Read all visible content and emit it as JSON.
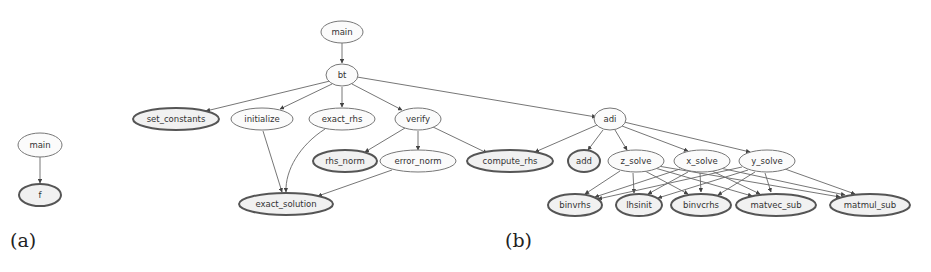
{
  "figure": {
    "panels": [
      {
        "id": "a",
        "caption": "(a)",
        "nodes": [
          {
            "id": "main",
            "label": "main",
            "leaf": false
          },
          {
            "id": "f",
            "label": "f",
            "leaf": true
          }
        ],
        "edges": [
          [
            "main",
            "f"
          ]
        ]
      },
      {
        "id": "b",
        "caption": "(b)",
        "nodes": [
          {
            "id": "main",
            "label": "main",
            "leaf": false
          },
          {
            "id": "bt",
            "label": "bt",
            "leaf": false
          },
          {
            "id": "set_constants",
            "label": "set_constants",
            "leaf": true
          },
          {
            "id": "initialize",
            "label": "initialize",
            "leaf": false
          },
          {
            "id": "exact_rhs",
            "label": "exact_rhs",
            "leaf": false
          },
          {
            "id": "verify",
            "label": "verify",
            "leaf": false
          },
          {
            "id": "adi",
            "label": "adi",
            "leaf": false
          },
          {
            "id": "rhs_norm",
            "label": "rhs_norm",
            "leaf": true
          },
          {
            "id": "error_norm",
            "label": "error_norm",
            "leaf": false
          },
          {
            "id": "compute_rhs",
            "label": "compute_rhs",
            "leaf": true
          },
          {
            "id": "add",
            "label": "add",
            "leaf": true
          },
          {
            "id": "z_solve",
            "label": "z_solve",
            "leaf": false
          },
          {
            "id": "x_solve",
            "label": "x_solve",
            "leaf": false
          },
          {
            "id": "y_solve",
            "label": "y_solve",
            "leaf": false
          },
          {
            "id": "exact_solution",
            "label": "exact_solution",
            "leaf": true
          },
          {
            "id": "binvrhs",
            "label": "binvrhs",
            "leaf": true
          },
          {
            "id": "lhsinit",
            "label": "lhsinit",
            "leaf": true
          },
          {
            "id": "binvcrhs",
            "label": "binvcrhs",
            "leaf": true
          },
          {
            "id": "matvec_sub",
            "label": "matvec_sub",
            "leaf": true
          },
          {
            "id": "matmul_sub",
            "label": "matmul_sub",
            "leaf": true
          }
        ],
        "edges": [
          [
            "main",
            "bt"
          ],
          [
            "bt",
            "set_constants"
          ],
          [
            "bt",
            "initialize"
          ],
          [
            "bt",
            "exact_rhs"
          ],
          [
            "bt",
            "verify"
          ],
          [
            "bt",
            "adi"
          ],
          [
            "initialize",
            "exact_solution"
          ],
          [
            "exact_rhs",
            "exact_solution"
          ],
          [
            "verify",
            "rhs_norm"
          ],
          [
            "verify",
            "error_norm"
          ],
          [
            "verify",
            "compute_rhs"
          ],
          [
            "error_norm",
            "exact_solution"
          ],
          [
            "adi",
            "compute_rhs"
          ],
          [
            "adi",
            "add"
          ],
          [
            "adi",
            "z_solve"
          ],
          [
            "adi",
            "x_solve"
          ],
          [
            "adi",
            "y_solve"
          ],
          [
            "z_solve",
            "binvrhs"
          ],
          [
            "z_solve",
            "lhsinit"
          ],
          [
            "z_solve",
            "binvcrhs"
          ],
          [
            "z_solve",
            "matvec_sub"
          ],
          [
            "z_solve",
            "matmul_sub"
          ],
          [
            "x_solve",
            "binvrhs"
          ],
          [
            "x_solve",
            "lhsinit"
          ],
          [
            "x_solve",
            "binvcrhs"
          ],
          [
            "x_solve",
            "matvec_sub"
          ],
          [
            "x_solve",
            "matmul_sub"
          ],
          [
            "y_solve",
            "binvrhs"
          ],
          [
            "y_solve",
            "lhsinit"
          ],
          [
            "y_solve",
            "binvcrhs"
          ],
          [
            "y_solve",
            "matvec_sub"
          ],
          [
            "y_solve",
            "matmul_sub"
          ]
        ]
      }
    ]
  },
  "labels": {
    "a": {
      "caption": "(a)",
      "main": "main",
      "f": "f"
    },
    "b": {
      "caption": "(b)",
      "main": "main",
      "bt": "bt",
      "set_constants": "set_constants",
      "initialize": "initialize",
      "exact_rhs": "exact_rhs",
      "verify": "verify",
      "adi": "adi",
      "rhs_norm": "rhs_norm",
      "error_norm": "error_norm",
      "compute_rhs": "compute_rhs",
      "add": "add",
      "z_solve": "z_solve",
      "x_solve": "x_solve",
      "y_solve": "y_solve",
      "exact_solution": "exact_solution",
      "binvrhs": "binvrhs",
      "lhsinit": "lhsinit",
      "binvcrhs": "binvcrhs",
      "matvec_sub": "matvec_sub",
      "matmul_sub": "matmul_sub"
    }
  },
  "colors": {
    "edge": "#666666",
    "node_border": "#777777",
    "leaf_border": "#555555",
    "background": "#ffffff"
  }
}
